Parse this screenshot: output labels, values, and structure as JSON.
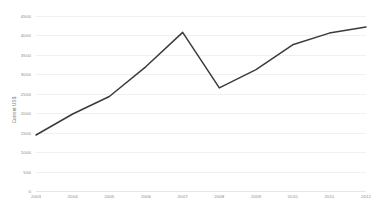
{
  "chart_data": {
    "type": "line",
    "title": "",
    "xlabel": "",
    "ylabel": "Current US$",
    "x": [
      2003,
      2004,
      2005,
      2006,
      2007,
      2008,
      2009,
      2010,
      2011,
      2012
    ],
    "categories": [
      "2003",
      "2004",
      "2005",
      "2006",
      "2007",
      "2008",
      "2009",
      "2010",
      "2011",
      "2012"
    ],
    "values": [
      1440,
      1980,
      2430,
      3200,
      4080,
      2650,
      3120,
      3760,
      4060,
      4220
    ],
    "series": [
      {
        "name": "Current US$",
        "values": [
          1440,
          1980,
          2430,
          3200,
          4080,
          2650,
          3120,
          3760,
          4060,
          4220
        ]
      }
    ],
    "ylim": [
      0,
      4500
    ],
    "yticks": [
      0,
      500,
      1000,
      1500,
      2000,
      2500,
      3000,
      3500,
      4000,
      4500
    ],
    "ytick_labels": [
      "0",
      "500",
      "1000",
      "1500",
      "2000",
      "2500",
      "3000",
      "3500",
      "4000",
      "4500"
    ],
    "grid": true,
    "legend": false,
    "legend_position": "none",
    "line_color": "#3b3b3b",
    "grid_color": "#f0f0f2",
    "background": "#ffffff"
  },
  "axes": {
    "y_axis_title": "Current US$"
  }
}
